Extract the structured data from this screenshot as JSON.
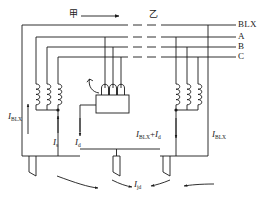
{
  "figure": {
    "type": "electrical-schematic",
    "stroke_color": "#1a1a1a",
    "text_color": "#1a1a1a",
    "background": "#ffffff"
  },
  "stations": {
    "left_label": "甲",
    "right_label": "乙",
    "direction_arrow": "right-arrow"
  },
  "bus_labels": [
    {
      "id": "blx",
      "text": "BLX"
    },
    {
      "id": "a",
      "text": "A"
    },
    {
      "id": "b",
      "text": "B"
    },
    {
      "id": "c",
      "text": "C"
    }
  ],
  "currents": {
    "left_sheath": {
      "symbol": "I",
      "sub": "BLX"
    },
    "left_s": {
      "symbol": "I",
      "sub": "s"
    },
    "left_d": {
      "symbol": "I",
      "sub": "d"
    },
    "right_sum": {
      "symbol": "I",
      "sub": "BLX",
      "operator": "+",
      "symbol2": "I",
      "sub2": "d"
    },
    "right_sheath": {
      "symbol": "I",
      "sub": "BLX"
    },
    "ground": {
      "symbol": "I",
      "sub": "jd"
    }
  },
  "components": {
    "left_coils_count": 3,
    "right_coils_count": 3,
    "device_coils_count": 3,
    "device_name": "current-measuring-device",
    "ground_symbols_count": 3
  }
}
